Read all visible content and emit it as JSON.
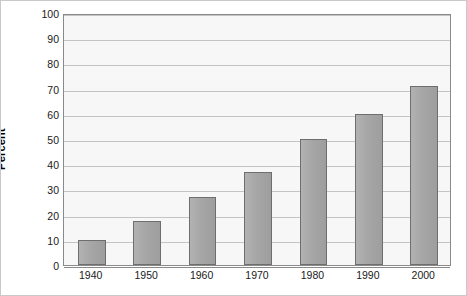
{
  "chart_data": {
    "type": "bar",
    "title": "",
    "subtitle": "",
    "xlabel": "",
    "ylabel": "Percent",
    "categories": [
      "1940",
      "1950",
      "1960",
      "1970",
      "1980",
      "1990",
      "2000"
    ],
    "values": [
      10,
      17.5,
      27,
      37,
      50,
      60,
      71
    ],
    "series": [
      {
        "name": "Percent",
        "values": [
          10,
          17.5,
          27,
          37,
          50,
          60,
          71
        ]
      }
    ],
    "ylim": [
      0,
      100
    ],
    "yticks": [
      0,
      10,
      20,
      30,
      40,
      50,
      60,
      70,
      80,
      90,
      100
    ],
    "ytick_labels": [
      "0",
      "10",
      "20",
      "30",
      "40",
      "50",
      "60",
      "70",
      "80",
      "90",
      "100"
    ],
    "grid": true,
    "grid_axis": "y",
    "legend": false,
    "legend_position": "none",
    "annotations": []
  },
  "style": {
    "bar_fill": "#a6a6a6",
    "bar_border": "#6e6e6e",
    "plot_background": "#f7f7f7",
    "gridline_color": "#c4c4c4",
    "axis_color": "#8a8a8a",
    "text_color": "#1a1a1a",
    "canvas_background": "#ffffff",
    "canvas_border": "#c9c9c9"
  }
}
